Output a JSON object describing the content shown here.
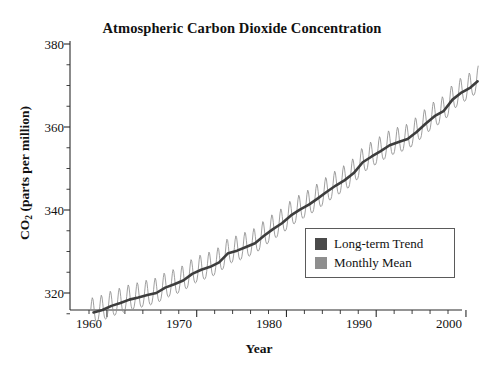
{
  "top_bleed_text": "",
  "chart_data": {
    "type": "line",
    "title": "Atmospheric Carbon Dioxide Concentration",
    "subtitle": "",
    "xlabel": "Year",
    "ylabel_main": "CO",
    "ylabel_sub": "2",
    "ylabel_rest": " (parts per million)",
    "ylabel_full": "CO2 (parts per million)",
    "xlim": [
      1958,
      2001.5
    ],
    "ylim": [
      310,
      382
    ],
    "xticks": [
      1960,
      1970,
      1980,
      1990,
      2000
    ],
    "xtick_labels": [
      "1960",
      "1970",
      "1980",
      "1990",
      "2000"
    ],
    "xminor_step": 2,
    "yticks": [
      320,
      340,
      360,
      380
    ],
    "ytick_labels": [
      "320",
      "340",
      "360",
      "380"
    ],
    "yminor_step": 5,
    "grid": false,
    "legend_position": "lower-right",
    "legend": [
      {
        "label": "Long-term Trend",
        "color": "#4a4a4a"
      },
      {
        "label": "Monthly Mean",
        "color": "#8e8e8e"
      }
    ],
    "series": [
      {
        "name": "Long-term Trend",
        "color": "#3d3d3d",
        "x": [
          1958.5,
          1959.5,
          1960.5,
          1961.5,
          1962.5,
          1963.5,
          1964.5,
          1965.5,
          1966.5,
          1967.5,
          1968.5,
          1969.5,
          1970.5,
          1971.5,
          1972.5,
          1973.5,
          1974.5,
          1975.5,
          1976.5,
          1977.5,
          1978.5,
          1979.5,
          1980.5,
          1981.5,
          1982.5,
          1983.5,
          1984.5,
          1985.5,
          1986.5,
          1987.5,
          1988.5,
          1989.5,
          1990.5,
          1991.5,
          1992.5,
          1993.5,
          1994.5,
          1995.5,
          1996.5,
          1997.5,
          1998.5,
          1999.5,
          2000.5,
          2001.3
        ],
        "values": [
          315.3,
          315.9,
          316.9,
          317.6,
          318.4,
          318.9,
          319.5,
          320.0,
          321.3,
          322.1,
          323.0,
          324.6,
          325.6,
          326.3,
          327.4,
          329.6,
          330.2,
          331.1,
          332.0,
          333.8,
          335.4,
          336.8,
          338.7,
          340.1,
          341.3,
          342.8,
          344.4,
          345.9,
          347.2,
          348.9,
          351.5,
          352.9,
          354.2,
          355.6,
          356.4,
          357.1,
          358.8,
          360.8,
          362.6,
          363.8,
          366.6,
          368.3,
          369.5,
          371.0
        ]
      },
      {
        "name": "Monthly Mean",
        "color": "#8e8e8e",
        "description": "Monthly observations oscillating seasonally about the long-term trend with an amplitude of roughly 3 ppm (peak in May, minimum in late September).",
        "seasonal_amplitude_ppm": 3.1,
        "peak_month_fraction": 0.38,
        "x_start": 1958.2,
        "x_end": 2001.4
      }
    ],
    "annotations": []
  }
}
